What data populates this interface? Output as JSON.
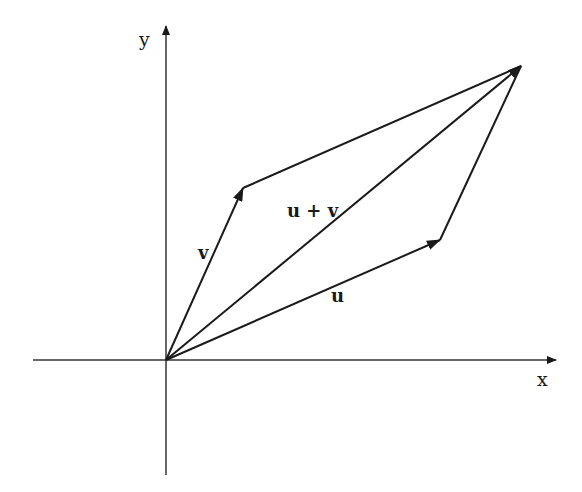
{
  "diagram": {
    "axes": {
      "x_label": "x",
      "y_label": "y",
      "origin": [
        166,
        360
      ],
      "x_axis": {
        "from": [
          33,
          360
        ],
        "to": [
          556,
          360
        ]
      },
      "y_axis": {
        "from": [
          166,
          475
        ],
        "to": [
          166,
          30
        ]
      }
    },
    "vectors": [
      {
        "id": "v",
        "label": "v",
        "from": [
          166,
          360
        ],
        "to": [
          243,
          188
        ],
        "arrow": true
      },
      {
        "id": "u",
        "label": "u",
        "from": [
          166,
          360
        ],
        "to": [
          440,
          240
        ],
        "arrow": true
      },
      {
        "id": "u_plus_v",
        "label": "u + v",
        "from": [
          166,
          360
        ],
        "to": [
          521,
          66
        ],
        "arrow": true
      }
    ],
    "edges": [
      {
        "id": "v-to-sum",
        "from": [
          243,
          188
        ],
        "to": [
          521,
          66
        ]
      },
      {
        "id": "u-to-sum",
        "from": [
          440,
          240
        ],
        "to": [
          521,
          66
        ]
      }
    ],
    "line_color": "#1a1a1a"
  }
}
